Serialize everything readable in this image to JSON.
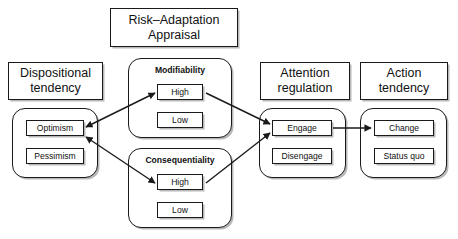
{
  "diagram": {
    "title_box": {
      "line1": "Risk–Adaptation",
      "line2": "Appraisal"
    },
    "columns": [
      {
        "header_line1": "Dispositional",
        "header_line2": "tendency",
        "group_label": "",
        "options": [
          "Optimism",
          "Pessimism"
        ]
      },
      {
        "header_line1": "",
        "header_line2": "",
        "group_label": "Modifiability",
        "options": [
          "High",
          "Low"
        ]
      },
      {
        "header_line1": "",
        "header_line2": "",
        "group_label": "Consequentiality",
        "options": [
          "High",
          "Low"
        ]
      },
      {
        "header_line1": "Attention",
        "header_line2": "regulation",
        "group_label": "",
        "options": [
          "Engage",
          "Disengage"
        ]
      },
      {
        "header_line1": "Action",
        "header_line2": "tendency",
        "group_label": "",
        "options": [
          "Change",
          "Status quo"
        ]
      }
    ],
    "colors": {
      "line": "#1a1a1a",
      "shadow": "#b8b8b8",
      "background": "#ffffff",
      "text": "#111111"
    },
    "connections": [
      {
        "from": "Optimism",
        "to": "Modifiability High",
        "kind": "bidirectional"
      },
      {
        "from": "Optimism",
        "to": "Consequentiality High",
        "kind": "bidirectional"
      },
      {
        "from": "Modifiability High",
        "to": "Engage",
        "kind": "directional"
      },
      {
        "from": "Consequentiality High",
        "to": "Engage",
        "kind": "directional"
      },
      {
        "from": "Engage",
        "to": "Change",
        "kind": "directional"
      }
    ]
  }
}
